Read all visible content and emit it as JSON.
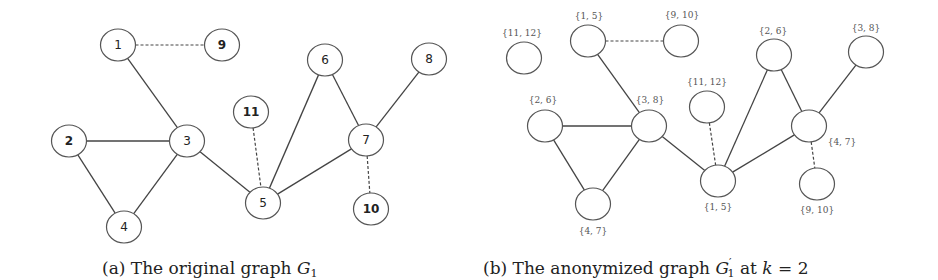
{
  "figure": {
    "panel_a": {
      "caption_prefix": "(a) The original graph ",
      "caption_symbol": "G",
      "caption_sub": "1",
      "nodes": [
        {
          "id": "1",
          "label": "1",
          "x": 118,
          "y": 45,
          "bold": false
        },
        {
          "id": "9",
          "label": "9",
          "x": 222,
          "y": 45,
          "bold": true
        },
        {
          "id": "2",
          "label": "2",
          "x": 69,
          "y": 141,
          "bold": true
        },
        {
          "id": "3",
          "label": "3",
          "x": 187,
          "y": 141,
          "bold": false
        },
        {
          "id": "4",
          "label": "4",
          "x": 124,
          "y": 227,
          "bold": false
        },
        {
          "id": "11",
          "label": "11",
          "x": 251,
          "y": 112,
          "bold": true
        },
        {
          "id": "5",
          "label": "5",
          "x": 263,
          "y": 203,
          "bold": false
        },
        {
          "id": "6",
          "label": "6",
          "x": 325,
          "y": 60,
          "bold": false
        },
        {
          "id": "7",
          "label": "7",
          "x": 366,
          "y": 140,
          "bold": false
        },
        {
          "id": "8",
          "label": "8",
          "x": 429,
          "y": 59,
          "bold": false
        },
        {
          "id": "10",
          "label": "10",
          "x": 371,
          "y": 209,
          "bold": true
        }
      ],
      "edges": [
        {
          "from": "1",
          "to": "9",
          "style": "dashed"
        },
        {
          "from": "1",
          "to": "3",
          "style": "solid"
        },
        {
          "from": "2",
          "to": "3",
          "style": "solid"
        },
        {
          "from": "2",
          "to": "4",
          "style": "solid"
        },
        {
          "from": "3",
          "to": "4",
          "style": "solid"
        },
        {
          "from": "3",
          "to": "5",
          "style": "solid"
        },
        {
          "from": "11",
          "to": "5",
          "style": "dashed"
        },
        {
          "from": "5",
          "to": "6",
          "style": "solid"
        },
        {
          "from": "6",
          "to": "7",
          "style": "solid"
        },
        {
          "from": "5",
          "to": "7",
          "style": "solid"
        },
        {
          "from": "7",
          "to": "8",
          "style": "solid"
        },
        {
          "from": "7",
          "to": "10",
          "style": "dashed"
        }
      ]
    },
    "panel_b": {
      "caption_prefix": "(b) The anonymized graph ",
      "caption_symbol": "G",
      "caption_prime": "′",
      "caption_sub": "1",
      "caption_mid": " at ",
      "caption_k": "k",
      "caption_suffix": " = 2",
      "nodes": [
        {
          "id": "b1",
          "label": "{11, 12}",
          "x": 524,
          "y": 58,
          "lx": 522,
          "ly": 36
        },
        {
          "id": "b2",
          "label": "{1, 5}",
          "x": 588,
          "y": 41,
          "lx": 589,
          "ly": 19
        },
        {
          "id": "b3",
          "label": "{9, 10}",
          "x": 681,
          "y": 41,
          "lx": 682,
          "ly": 18
        },
        {
          "id": "b4",
          "label": "{2, 6}",
          "x": 545,
          "y": 126,
          "lx": 543,
          "ly": 103
        },
        {
          "id": "b5",
          "label": "{3, 8}",
          "x": 649,
          "y": 126,
          "lx": 650,
          "ly": 103
        },
        {
          "id": "b6",
          "label": "{4, 7}",
          "x": 593,
          "y": 204,
          "lx": 593,
          "ly": 234
        },
        {
          "id": "b7",
          "label": "{11, 12}",
          "x": 707,
          "y": 107,
          "lx": 707,
          "ly": 85
        },
        {
          "id": "b8",
          "label": "{1, 5}",
          "x": 718,
          "y": 181,
          "lx": 718,
          "ly": 210
        },
        {
          "id": "b9",
          "label": "{2, 6}",
          "x": 774,
          "y": 55,
          "lx": 773,
          "ly": 34
        },
        {
          "id": "b10",
          "label": "{3, 8}",
          "x": 866,
          "y": 52,
          "lx": 866,
          "ly": 31
        },
        {
          "id": "b11",
          "label": "{4, 7}",
          "x": 809,
          "y": 126,
          "lx": 842,
          "ly": 145
        },
        {
          "id": "b12",
          "label": "{9, 10}",
          "x": 817,
          "y": 184,
          "lx": 817,
          "ly": 213
        }
      ],
      "edges": [
        {
          "from": "b2",
          "to": "b3",
          "style": "dashed"
        },
        {
          "from": "b2",
          "to": "b5",
          "style": "solid"
        },
        {
          "from": "b4",
          "to": "b5",
          "style": "solid"
        },
        {
          "from": "b4",
          "to": "b6",
          "style": "solid"
        },
        {
          "from": "b5",
          "to": "b6",
          "style": "solid"
        },
        {
          "from": "b5",
          "to": "b8",
          "style": "solid"
        },
        {
          "from": "b7",
          "to": "b8",
          "style": "dashed"
        },
        {
          "from": "b8",
          "to": "b9",
          "style": "solid"
        },
        {
          "from": "b9",
          "to": "b11",
          "style": "solid"
        },
        {
          "from": "b8",
          "to": "b11",
          "style": "solid"
        },
        {
          "from": "b11",
          "to": "b10",
          "style": "solid"
        },
        {
          "from": "b11",
          "to": "b12",
          "style": "dashed"
        }
      ]
    }
  }
}
